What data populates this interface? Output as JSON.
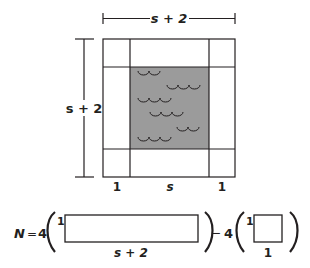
{
  "figure": {
    "top_dimension_label": "s + 2",
    "left_dimension_label": "s + 2",
    "bottom_labels": [
      "1",
      "s",
      "1"
    ],
    "colors": {
      "stroke": "#231f20",
      "pool_fill": "#9b9b9b",
      "background": "#ffffff"
    },
    "pool_icon": "water-waves"
  },
  "equation": {
    "lhs": "N",
    "equals": "=",
    "coef1": "4",
    "rect_top_label": "1",
    "rect_bottom_label": "s + 2",
    "minus": "−",
    "coef2": "4",
    "square_top_label": "1",
    "square_bottom_label": "1"
  }
}
